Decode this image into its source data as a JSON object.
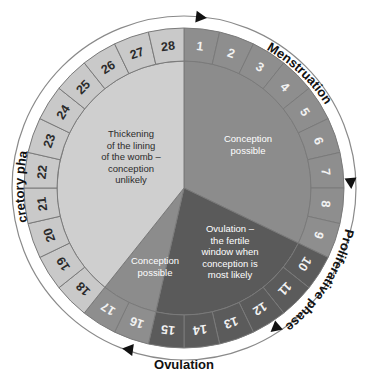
{
  "diagram": {
    "cycle_length_days": 28,
    "center": {
      "x": 184,
      "y": 188
    },
    "radii": {
      "outer_arrow_ring": 178,
      "ring_outer": 160,
      "ring_inner": 127,
      "pie": 127
    },
    "day_one_angle_deg": 0,
    "direction": "clockwise"
  },
  "colors": {
    "background": "#ffffff",
    "outline": "#7a7a7a",
    "ring_menstruation": "#8e8e8e",
    "ring_proliferative": "#6e6e6e",
    "ring_ovulation": "#5b5b5b",
    "ring_conception_possible": "#8e8e8e",
    "ring_secretory": "#c9c9c9",
    "pie_conception_possible": "#8c8c8c",
    "pie_ovulation": "#5a5a5a",
    "pie_conception_possible_2": "#8c8c8c",
    "pie_secretory": "#cfcfcf",
    "arrow": "#111111",
    "text_dark": "#2b2b2b",
    "text_light": "#ffffff"
  },
  "days": [
    {
      "n": "1",
      "band": "proliferative"
    },
    {
      "n": "2",
      "band": "proliferative"
    },
    {
      "n": "3",
      "band": "proliferative"
    },
    {
      "n": "4",
      "band": "proliferative"
    },
    {
      "n": "5",
      "band": "proliferative"
    },
    {
      "n": "6",
      "band": "proliferative"
    },
    {
      "n": "7",
      "band": "proliferative"
    },
    {
      "n": "8",
      "band": "proliferative"
    },
    {
      "n": "9",
      "band": "proliferative"
    },
    {
      "n": "10",
      "band": "ovulation"
    },
    {
      "n": "11",
      "band": "ovulation"
    },
    {
      "n": "12",
      "band": "ovulation"
    },
    {
      "n": "13",
      "band": "ovulation"
    },
    {
      "n": "14",
      "band": "ovulation"
    },
    {
      "n": "15",
      "band": "ovulation"
    },
    {
      "n": "16",
      "band": "conception"
    },
    {
      "n": "17",
      "band": "conception"
    },
    {
      "n": "18",
      "band": "secretory"
    },
    {
      "n": "19",
      "band": "secretory"
    },
    {
      "n": "20",
      "band": "secretory"
    },
    {
      "n": "21",
      "band": "secretory"
    },
    {
      "n": "22",
      "band": "secretory"
    },
    {
      "n": "23",
      "band": "secretory"
    },
    {
      "n": "24",
      "band": "secretory"
    },
    {
      "n": "25",
      "band": "secretory"
    },
    {
      "n": "26",
      "band": "secretory"
    },
    {
      "n": "27",
      "band": "secretory"
    },
    {
      "n": "28",
      "band": "secretory"
    }
  ],
  "sectors": [
    {
      "id": "conception-possible-early",
      "label_lines": [
        "Conception",
        "possible"
      ],
      "start_day": 1,
      "end_day": 9,
      "text_color": "light"
    },
    {
      "id": "ovulation-fertile-window",
      "label_lines": [
        "Ovulation –",
        "the fertile",
        "window when",
        "conception is",
        "most likely"
      ],
      "start_day": 10,
      "end_day": 15,
      "text_color": "light"
    },
    {
      "id": "conception-possible-late",
      "label_lines": [
        "Conception",
        "possible"
      ],
      "start_day": 16,
      "end_day": 17,
      "text_color": "light"
    },
    {
      "id": "thickening-lining",
      "label_lines": [
        "Thickening",
        "of the lining",
        "of the womb –",
        "conception",
        "unlikely"
      ],
      "start_day": 18,
      "end_day": 28,
      "text_color": "dark"
    }
  ],
  "phase_labels": {
    "menstruation": "Menstruation",
    "proliferative": "Proliferative phase",
    "ovulation": "Ovulation",
    "secretory": "Secretory phase"
  },
  "chart_data": {
    "type": "pie",
    "categories": [
      "Conception possible",
      "Ovulation – the fertile window when conception is most likely",
      "Conception possible",
      "Thickening of the lining of the womb – conception unlikely"
    ],
    "values": [
      9,
      6,
      2,
      11
    ],
    "unit": "days",
    "total": 28,
    "legend": "none",
    "grid": false,
    "outer_ring_labels": [
      "1",
      "2",
      "3",
      "4",
      "5",
      "6",
      "7",
      "8",
      "9",
      "10",
      "11",
      "12",
      "13",
      "14",
      "15",
      "16",
      "17",
      "18",
      "19",
      "20",
      "21",
      "22",
      "23",
      "24",
      "25",
      "26",
      "27",
      "28"
    ],
    "outer_phase_annotations": [
      "Menstruation",
      "Proliferative phase",
      "Ovulation",
      "Secretory phase"
    ]
  }
}
